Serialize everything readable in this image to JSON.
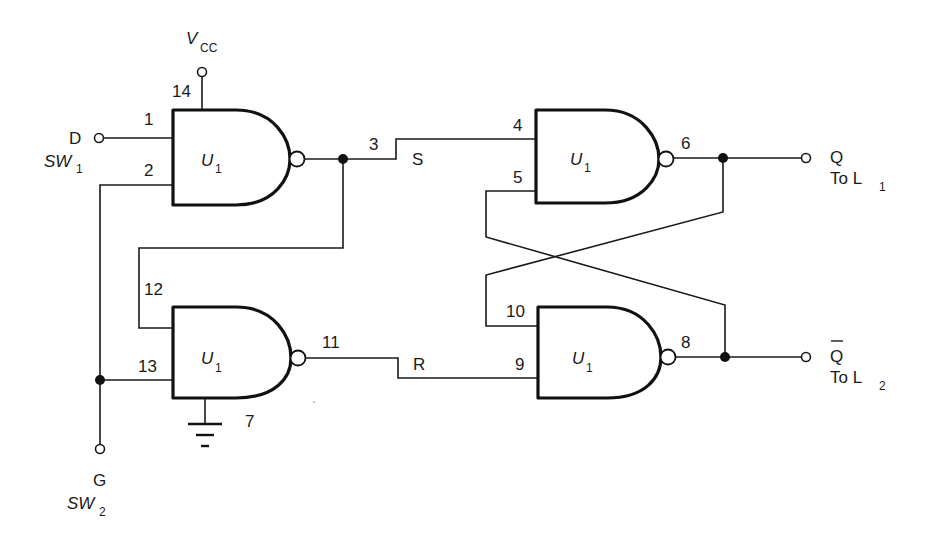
{
  "diagram": {
    "type": "circuit-schematic",
    "supply": {
      "label": "V",
      "subscript": "CC",
      "pin": "14"
    },
    "ground": {
      "pin": "7"
    },
    "inputs": {
      "d": {
        "label": "D",
        "switch": "SW",
        "switch_sub": "1"
      },
      "g": {
        "label": "G",
        "switch": "SW",
        "switch_sub": "2"
      }
    },
    "outputs": {
      "q": {
        "label": "Q",
        "dest": "To L",
        "dest_sub": "1"
      },
      "qbar": {
        "label": "Q",
        "overbar": true,
        "dest": "To L",
        "dest_sub": "2"
      }
    },
    "signals": {
      "s": "S",
      "r": "R"
    },
    "gates": [
      {
        "id": "gate-top-left",
        "name": "U",
        "sub": "1",
        "inputs": [
          "1",
          "2"
        ],
        "output": "3"
      },
      {
        "id": "gate-bottom-left",
        "name": "U",
        "sub": "1",
        "inputs": [
          "12",
          "13"
        ],
        "output": "11"
      },
      {
        "id": "gate-top-right",
        "name": "U",
        "sub": "1",
        "inputs": [
          "4",
          "5"
        ],
        "output": "6"
      },
      {
        "id": "gate-bottom-right",
        "name": "U",
        "sub": "1",
        "inputs": [
          "10",
          "9"
        ],
        "output": "8"
      }
    ],
    "colors": {
      "ink": "#111111",
      "background": "#ffffff"
    }
  }
}
